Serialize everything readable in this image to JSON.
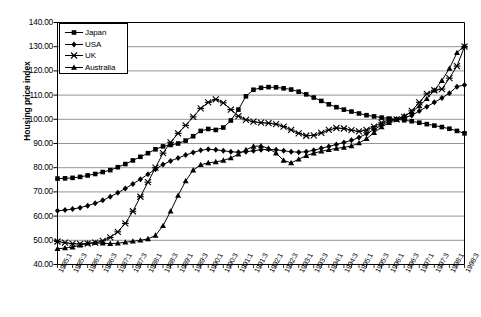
{
  "chart_data": {
    "type": "line",
    "title": "",
    "xlabel": "",
    "ylabel": "Housing price index",
    "ylim": [
      40,
      140
    ],
    "ytick_step": 10,
    "yticks": [
      "40.00",
      "50.00",
      "60.00",
      "70.00",
      "80.00",
      "90.00",
      "100.00",
      "110.00",
      "120.00",
      "130.00",
      "140.00"
    ],
    "grid": true,
    "legend_position": "top-left",
    "x": [
      "1985:1",
      "1985:2",
      "1985:3",
      "1985:4",
      "1986:1",
      "1986:2",
      "1986:3",
      "1986:4",
      "1987:1",
      "1987:2",
      "1987:3",
      "1987:4",
      "1988:1",
      "1988:2",
      "1988:3",
      "1988:4",
      "1989:1",
      "1989:2",
      "1989:3",
      "1989:4",
      "1990:1",
      "1990:2",
      "1990:3",
      "1990:4",
      "1991:1",
      "1991:2",
      "1991:3",
      "1991:4",
      "1992:1",
      "1992:2",
      "1992:3",
      "1992:4",
      "1993:1",
      "1993:2",
      "1993:3",
      "1993:4",
      "1994:1",
      "1994:2",
      "1994:3",
      "1994:4",
      "1995:1",
      "1995:2",
      "1995:3",
      "1995:4",
      "1996:1",
      "1996:2",
      "1996:3",
      "1996:4",
      "1997:1",
      "1997:2",
      "1997:3",
      "1997:4",
      "1998:1",
      "1998:2",
      "1998:3"
    ],
    "xtick_labels": [
      "1985:1",
      "1985:3",
      "1986:1",
      "1986:3",
      "1987:1",
      "1987:3",
      "1988:1",
      "1988:3",
      "1989:1",
      "1989:3",
      "1990:1",
      "1990:3",
      "1991:1",
      "1991:3",
      "1992:1",
      "1992:3",
      "1993:1",
      "1993:3",
      "1994:1",
      "1994:3",
      "1995:1",
      "1995:3",
      "1996:1",
      "1996:3",
      "1997:1",
      "1997:3",
      "1998:1",
      "1998:3"
    ],
    "series": [
      {
        "name": "Japan",
        "marker": "square",
        "values": [
          75.5,
          75.6,
          75.8,
          76.2,
          76.8,
          77.4,
          78.2,
          79.0,
          80.2,
          81.5,
          83.0,
          84.5,
          86.0,
          87.6,
          88.8,
          89.4,
          90.0,
          91.2,
          93.0,
          95.2,
          96.0,
          95.6,
          96.6,
          99.5,
          104.0,
          109.5,
          112.2,
          113.0,
          113.3,
          113.2,
          112.8,
          112.3,
          111.4,
          110.3,
          109.0,
          107.6,
          106.2,
          105.0,
          104.0,
          103.2,
          102.4,
          101.7,
          101.2,
          100.7,
          100.3,
          100.0,
          99.6,
          99.2,
          98.6,
          98.0,
          97.4,
          96.8,
          96.1,
          95.2,
          94.2
        ]
      },
      {
        "name": "USA",
        "marker": "diamond",
        "values": [
          62.2,
          62.5,
          62.9,
          63.5,
          64.3,
          65.3,
          66.5,
          68.0,
          69.6,
          71.4,
          73.3,
          75.2,
          77.3,
          79.4,
          81.3,
          82.8,
          84.0,
          85.2,
          86.3,
          87.2,
          87.6,
          87.4,
          87.0,
          86.6,
          86.4,
          86.6,
          87.0,
          87.4,
          87.6,
          87.4,
          87.0,
          86.6,
          86.4,
          86.6,
          87.2,
          88.0,
          88.8,
          89.6,
          90.4,
          91.3,
          92.5,
          94.0,
          95.8,
          97.6,
          99.2,
          100.0,
          100.6,
          101.6,
          103.4,
          105.2,
          107.0,
          108.8,
          110.8,
          113.5,
          114.2
        ]
      },
      {
        "name": "UK",
        "marker": "cross",
        "values": [
          49.5,
          49.0,
          48.6,
          48.5,
          48.6,
          49.0,
          49.8,
          51.2,
          53.5,
          57.0,
          62.0,
          68.0,
          74.0,
          80.0,
          86.0,
          90.5,
          94.2,
          97.5,
          101.0,
          104.5,
          107.0,
          108.2,
          106.8,
          104.0,
          101.3,
          99.8,
          99.0,
          98.6,
          98.4,
          98.0,
          97.0,
          95.6,
          94.2,
          93.2,
          93.4,
          94.4,
          95.6,
          96.4,
          96.2,
          95.5,
          95.0,
          95.6,
          97.0,
          98.6,
          99.8,
          100.0,
          101.0,
          103.5,
          107.0,
          110.5,
          112.0,
          112.5,
          117.0,
          122.0,
          130.0
        ]
      },
      {
        "name": "Australia",
        "marker": "triangle",
        "values": [
          46.5,
          46.8,
          47.2,
          48.0,
          48.8,
          49.0,
          48.8,
          48.6,
          48.8,
          49.2,
          49.6,
          50.0,
          50.6,
          52.0,
          56.0,
          62.0,
          68.5,
          74.5,
          79.0,
          81.2,
          82.0,
          82.4,
          83.0,
          84.0,
          85.6,
          87.4,
          88.8,
          89.0,
          88.0,
          86.0,
          83.0,
          82.0,
          83.5,
          85.0,
          86.0,
          86.8,
          87.4,
          88.0,
          88.4,
          89.0,
          90.2,
          92.0,
          94.5,
          96.8,
          98.6,
          100.0,
          101.4,
          103.0,
          105.5,
          108.5,
          112.0,
          116.0,
          121.0,
          127.5,
          130.5
        ]
      }
    ]
  }
}
